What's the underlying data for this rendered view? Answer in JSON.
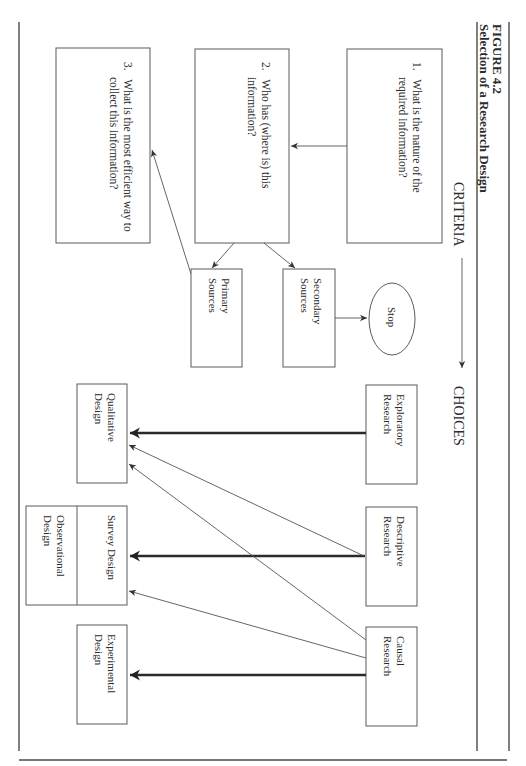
{
  "figure": {
    "label": "FIGURE 4.2",
    "title": "Selection of a Research Design"
  },
  "headings": {
    "criteria": "CRITERIA",
    "choices": "CHOICES"
  },
  "criteria": [
    {
      "number": "1.",
      "line1": "What is the nature of the",
      "line2": "required information?"
    },
    {
      "number": "2.",
      "line1": "Who has (where is) this",
      "line2": "information?"
    },
    {
      "number": "3.",
      "line1": "What is the most efficient way to",
      "line2": "collect this information?"
    }
  ],
  "sources": {
    "primary": {
      "line1": "Primary",
      "line2": "Sources"
    },
    "secondary": {
      "line1": "Secondary",
      "line2": "Sources"
    },
    "stop": "Stop"
  },
  "research_types": [
    {
      "line1": "Exploratory",
      "line2": "Research"
    },
    {
      "line1": "Descriptive",
      "line2": "Research"
    },
    {
      "line1": "Causal",
      "line2": "Research"
    }
  ],
  "designs": {
    "qualitative": {
      "line1": "Qualitative",
      "line2": "Design"
    },
    "survey": "Survey Design",
    "observational": {
      "line1": "Observational",
      "line2": "Design"
    },
    "experimental": {
      "line1": "Experimental",
      "line2": "Design"
    }
  },
  "connections": [
    {
      "from": "criterion-1",
      "to": "criterion-2",
      "weight": "thin"
    },
    {
      "from": "criterion-2",
      "to": "primary-sources",
      "weight": "thin"
    },
    {
      "from": "criterion-2",
      "to": "secondary-sources",
      "weight": "thin"
    },
    {
      "from": "secondary-sources",
      "to": "stop",
      "weight": "thin"
    },
    {
      "from": "primary-sources",
      "to": "criterion-3",
      "weight": "thin"
    },
    {
      "from": "criteria",
      "to": "choices",
      "weight": "thin"
    },
    {
      "from": "exploratory-research",
      "to": "qualitative-design",
      "weight": "thick"
    },
    {
      "from": "descriptive-research",
      "to": "survey-design",
      "weight": "thick"
    },
    {
      "from": "descriptive-research",
      "to": "qualitative-design",
      "weight": "thin"
    },
    {
      "from": "causal-research",
      "to": "experimental-design",
      "weight": "thick"
    },
    {
      "from": "causal-research",
      "to": "qualitative-design",
      "weight": "thin"
    },
    {
      "from": "causal-research",
      "to": "survey-design",
      "weight": "thin"
    }
  ],
  "colors": {
    "line": "#555555",
    "text": "#2b2b2b",
    "background": "#ffffff"
  }
}
